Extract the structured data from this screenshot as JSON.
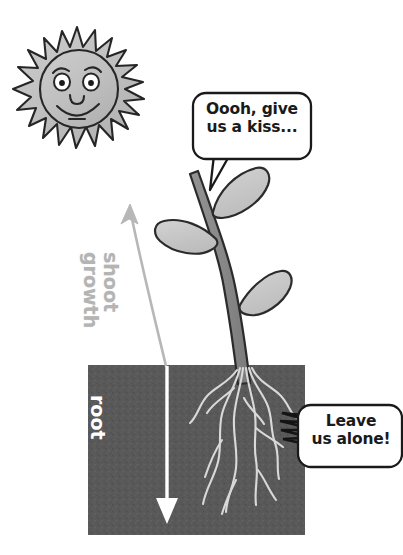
{
  "figure": {
    "canvas": {
      "width": 403,
      "height": 555,
      "background": "#ffffff"
    }
  },
  "sun": {
    "icon": "sun-with-face-icon",
    "fill": "#c0c0c0",
    "outline": "#262626",
    "face": {
      "eyes": 2,
      "eyebrows": 2,
      "nose": true,
      "mouth": "smile"
    },
    "rays": 20
  },
  "plant": {
    "stem": {
      "fill": "#8a8a8a",
      "outline": "#2b2b2b"
    },
    "leaves": {
      "count": 3,
      "fill": "#c8c8c8",
      "outline": "#2b2b2b"
    },
    "roots": {
      "count": 6,
      "stroke": "#d8d8d8"
    }
  },
  "soil": {
    "label": "soil",
    "fill": "#595959",
    "x": 88,
    "y": 365,
    "width": 217,
    "height": 170
  },
  "bubbles": [
    {
      "id": "shoot-bubble",
      "text": "Oooh, give\nus a kiss...",
      "speaker": "shoot",
      "tail": "pointed",
      "fill": "#ffffff",
      "outline": "#1a1a1a"
    },
    {
      "id": "root-bubble",
      "text": "Leave\nus alone!",
      "speaker": "roots",
      "tail": "jagged",
      "fill": "#ffffff",
      "outline": "#1a1a1a"
    }
  ],
  "arrows": [
    {
      "id": "shoot-growth-arrow",
      "label": "shoot\ngrowth",
      "direction": "up",
      "shape": "curved",
      "color": "#b4b4b4",
      "text_color": "#b4b4b4"
    },
    {
      "id": "root-growth-arrow",
      "label": "root\ngrowth",
      "direction": "down",
      "shape": "straight",
      "color": "#ffffff",
      "text_color": "#ffffff"
    }
  ]
}
